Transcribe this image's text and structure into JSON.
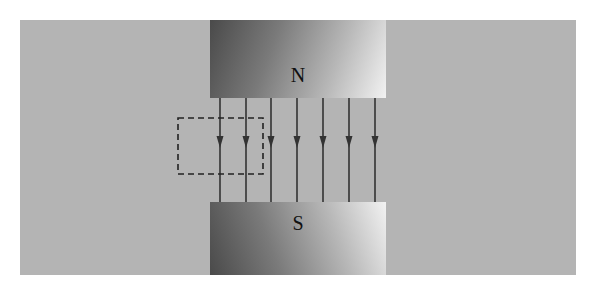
{
  "diagram": {
    "title": "",
    "north_pole": {
      "label": "N"
    },
    "south_pole": {
      "label": "S"
    },
    "field_lines": {
      "count": 7,
      "direction": "down",
      "x_positions": [
        220,
        246,
        271,
        297,
        323,
        349,
        375
      ],
      "y_start": 98,
      "y_end": 202,
      "arrow_y": 142,
      "color": "#333333"
    },
    "dashed_region": {
      "x": 178,
      "y": 118,
      "width": 85,
      "height": 56,
      "color": "#222222"
    },
    "colors": {
      "background": "#b4b4b4",
      "magnet_dark": "#4a4a4a",
      "magnet_light": "#f2f2f2"
    }
  }
}
